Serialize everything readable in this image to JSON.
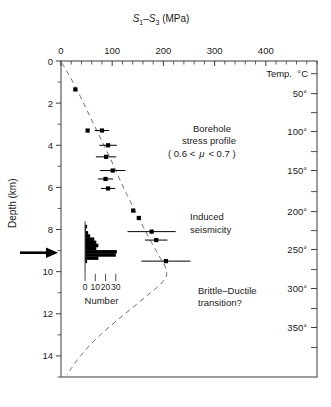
{
  "chart_data": {
    "type": "scatter",
    "title": "",
    "xlabel": "S1-S3 (MPa)",
    "xlabel_parts": {
      "s": "S",
      "sub1": "1",
      "minus": "–",
      "sub3": "3",
      "units": "(MPa)"
    },
    "ylabel": "Depth (km)",
    "xlim": [
      0,
      500
    ],
    "ylim": [
      0,
      15
    ],
    "y_inverted": true,
    "grid": false,
    "legend": "none",
    "x_ticks_major": [
      0,
      100,
      200,
      300,
      400
    ],
    "x_ticks_major_labels": [
      "0",
      "100",
      "200",
      "300",
      "400"
    ],
    "x_minor_interval": 20,
    "y_ticks_major": [
      0,
      2,
      4,
      6,
      8,
      10,
      12,
      14
    ],
    "y_ticks_major_labels": [
      "0",
      "2",
      "4",
      "6",
      "8",
      "10",
      "12",
      "14"
    ],
    "y_ticks_minor": [
      1,
      3,
      5,
      7,
      9,
      11,
      13,
      15
    ],
    "secondary_axis": {
      "title": "Temp.  °C",
      "title_name": "Temp.",
      "title_units": "°C",
      "ticks": [
        {
          "label": "50°",
          "depth": 1.55
        },
        {
          "label": "100°",
          "depth": 3.35
        },
        {
          "label": "150°",
          "depth": 5.2
        },
        {
          "label": "200°",
          "depth": 7.15
        },
        {
          "label": "250°",
          "depth": 8.95
        },
        {
          "label": "300°",
          "depth": 10.8
        },
        {
          "label": "350°",
          "depth": 12.65
        }
      ],
      "minor_ticks_depth": [
        0.6,
        2.45,
        4.3,
        6.2,
        8.05,
        9.9,
        11.75,
        13.6
      ]
    },
    "series": [
      {
        "name": "Borehole stress profile",
        "marker": "square",
        "points": [
          {
            "x": 28,
            "depth": 1.35,
            "xerr": 0
          },
          {
            "x": 52,
            "depth": 3.3,
            "xerr": 0
          },
          {
            "x": 80,
            "depth": 3.3,
            "xerr": 14
          },
          {
            "x": 92,
            "depth": 4.0,
            "xerr": 17
          },
          {
            "x": 88,
            "depth": 4.55,
            "xerr": 20
          },
          {
            "x": 101,
            "depth": 5.2,
            "xerr": 25
          },
          {
            "x": 87,
            "depth": 5.6,
            "xerr": 15
          },
          {
            "x": 92,
            "depth": 6.05,
            "xerr": 14
          },
          {
            "x": 141,
            "depth": 7.1,
            "xerr": 0
          },
          {
            "x": 152,
            "depth": 7.45,
            "xerr": 0
          },
          {
            "x": 177,
            "depth": 8.1,
            "xerr": 47
          },
          {
            "x": 186,
            "depth": 8.5,
            "xerr": 22
          },
          {
            "x": 205,
            "depth": 9.5,
            "xerr": 48
          }
        ]
      }
    ],
    "histogram": {
      "axis_label": "Number",
      "ticks": [
        0,
        10,
        20,
        30
      ],
      "tick_labels": [
        "0",
        "10",
        "20",
        "30"
      ],
      "orientation": "horizontal-bars",
      "bars": [
        {
          "depth": 7.85,
          "count": 2
        },
        {
          "depth": 8.0,
          "count": 1
        },
        {
          "depth": 8.15,
          "count": 3
        },
        {
          "depth": 8.3,
          "count": 5
        },
        {
          "depth": 8.45,
          "count": 9
        },
        {
          "depth": 8.6,
          "count": 11
        },
        {
          "depth": 8.75,
          "count": 13
        },
        {
          "depth": 8.9,
          "count": 11
        },
        {
          "depth": 9.05,
          "count": 31
        },
        {
          "depth": 9.2,
          "count": 30
        },
        {
          "depth": 9.35,
          "count": 13
        },
        {
          "depth": 9.5,
          "count": 2
        }
      ]
    },
    "curve": {
      "name": "Brittle-Ductile strength envelope",
      "style": "dashed",
      "points": [
        {
          "x": 2,
          "depth": 0.1
        },
        {
          "x": 26,
          "depth": 1.1
        },
        {
          "x": 50,
          "depth": 2.3
        },
        {
          "x": 74,
          "depth": 3.5
        },
        {
          "x": 98,
          "depth": 4.7
        },
        {
          "x": 118,
          "depth": 5.8
        },
        {
          "x": 140,
          "depth": 6.9
        },
        {
          "x": 163,
          "depth": 8.0
        },
        {
          "x": 190,
          "depth": 9.2
        },
        {
          "x": 210,
          "depth": 10.0
        },
        {
          "x": 200,
          "depth": 10.5
        },
        {
          "x": 170,
          "depth": 11.1
        },
        {
          "x": 130,
          "depth": 11.9
        },
        {
          "x": 90,
          "depth": 12.7
        },
        {
          "x": 55,
          "depth": 13.5
        },
        {
          "x": 28,
          "depth": 14.3
        },
        {
          "x": 12,
          "depth": 14.9
        }
      ]
    },
    "annotations": [
      {
        "id": "borehole",
        "lines": [
          "Borehole",
          "stress profile"
        ],
        "x": 212,
        "depth": 3.6
      },
      {
        "id": "friction",
        "text": "( 0.6 <  μ  < 0.7 )",
        "x": 212,
        "depth": 5.0
      },
      {
        "id": "induced",
        "lines": [
          "Induced",
          "seismicity"
        ],
        "x": 300,
        "depth": 7.7
      },
      {
        "id": "brittle",
        "lines": [
          "Brittle–Ductile",
          "transition?"
        ],
        "x": 312,
        "depth": 11.3
      }
    ],
    "marker_arrow": {
      "depth": 9.1,
      "label": "depth-marker-arrow"
    }
  },
  "labels": {
    "xaxis_title_full": "S₁–S₃ (MPa)",
    "yaxis_title": "Depth (km)",
    "temp_title": "Temp.  °C",
    "temp_name": "Temp.",
    "temp_units": "°C",
    "hist_axis_title": "Number",
    "annot_borehole_l1": "Borehole",
    "annot_borehole_l2": "stress profile",
    "annot_friction": "( 0.6 <  μ  < 0.7 )",
    "annot_friction_pre": "( 0.6 <",
    "annot_friction_mu": "μ",
    "annot_friction_post": "< 0.7 )",
    "annot_induced_l1": "Induced",
    "annot_induced_l2": "seismicity",
    "annot_brittle_l1": "Brittle–Ductile",
    "annot_brittle_l2": "transition?"
  },
  "colors": {
    "ink": "#1a1a1a",
    "axis": "#3a3a3a",
    "marker": "#000000",
    "curve": "#6a6a6a",
    "background": "#ffffff"
  }
}
